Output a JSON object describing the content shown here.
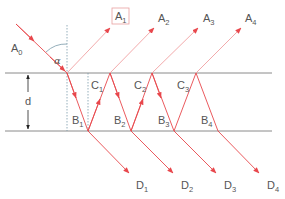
{
  "diagram": {
    "colors": {
      "ray": "#e8474c",
      "ray_faint": "#f0a0a2",
      "surface": "#8a8a8a",
      "normal": "#7a9aaa",
      "text": "#555555",
      "box": "#e8a0a0"
    },
    "labels": {
      "incident": {
        "base": "A",
        "sub": "0"
      },
      "angle": "α",
      "thickness": "d",
      "reflected": [
        {
          "base": "A",
          "sub": "1",
          "boxed": true
        },
        {
          "base": "A",
          "sub": "2"
        },
        {
          "base": "A",
          "sub": "3"
        },
        {
          "base": "A",
          "sub": "4"
        }
      ],
      "upper_points": [
        {
          "base": "C",
          "sub": "1"
        },
        {
          "base": "C",
          "sub": "2"
        },
        {
          "base": "C",
          "sub": "3"
        }
      ],
      "lower_points": [
        {
          "base": "B",
          "sub": "1"
        },
        {
          "base": "B",
          "sub": "2"
        },
        {
          "base": "B",
          "sub": "3"
        },
        {
          "base": "B",
          "sub": "4"
        }
      ],
      "transmitted": [
        {
          "base": "D",
          "sub": "1"
        },
        {
          "base": "D",
          "sub": "2"
        },
        {
          "base": "D",
          "sub": "3"
        },
        {
          "base": "D",
          "sub": "4"
        }
      ]
    }
  }
}
